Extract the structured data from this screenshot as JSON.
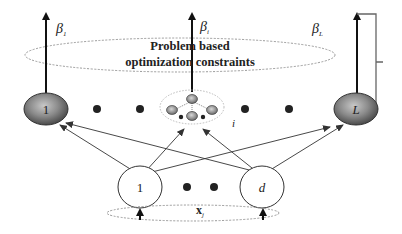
{
  "diagram": {
    "type": "neural-network",
    "constraint_region": {
      "line1": "Problem based",
      "line2": "optimization constraints"
    },
    "outputs": {
      "left": "β",
      "left_sub": "1",
      "middle": "β",
      "middle_sub": "i",
      "right": "β",
      "right_sub": "L"
    },
    "hidden_layer": {
      "first_label": "1",
      "middle_label": "i",
      "last_label": "L"
    },
    "input_layer": {
      "first_label": "1",
      "last_label": "d",
      "input_vector": "x",
      "input_sub": "j"
    },
    "colors": {
      "node_dark": "#5a5a5a",
      "node_light": "#bdbdbd",
      "stroke": "#333333",
      "ellipse_dotted": "#9a9a9a",
      "background": "#ffffff"
    }
  }
}
